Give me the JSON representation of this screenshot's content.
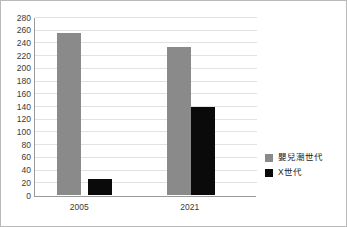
{
  "chart_data": {
    "type": "bar",
    "title": "",
    "subtitle": "",
    "xlabel": "",
    "ylabel": "",
    "categories": [
      "2005",
      "2021"
    ],
    "series": [
      {
        "name": "嬰兒潮世代",
        "color": "#8a8a8a",
        "values": [
          256,
          234
        ]
      },
      {
        "name": "X世代",
        "color": "#0a0a0a",
        "values": [
          26,
          140
        ]
      }
    ],
    "ylim": [
      0,
      280
    ],
    "ytick_step": 20,
    "yticks": [
      0,
      20,
      40,
      60,
      80,
      100,
      120,
      140,
      160,
      180,
      200,
      220,
      240,
      260,
      280
    ],
    "ytick_labels": [
      "0",
      "20",
      "40",
      "60",
      "80",
      "100",
      "120",
      "140",
      "160",
      "180",
      "200",
      "220",
      "240",
      "260",
      "280"
    ],
    "grid": true,
    "grid_axis": "y",
    "legend_position": "right"
  },
  "legend": {
    "items": [
      {
        "label": "嬰兒潮世代",
        "color": "#8a8a8a"
      },
      {
        "label": "X世代",
        "color": "#0a0a0a"
      }
    ]
  },
  "colors": {
    "boomer": "#8a8a8a",
    "genx": "#0a0a0a",
    "gridline": "#e2e2e2",
    "axis": "#9a9a9a",
    "border": "#b9b9b9",
    "text": "#3a3a3a"
  }
}
